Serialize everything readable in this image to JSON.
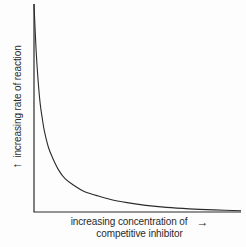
{
  "figure": {
    "background_color": "#fdfdfd",
    "line_color": "#2b2b2b"
  },
  "axes": {
    "y": {
      "label": "increasing rate of reaction",
      "arrow_glyph": "↑",
      "arrow_name": "up-arrow-icon"
    },
    "x": {
      "label_line_one": "increasing concentration of",
      "label_line_two": "competitive inhibitor",
      "arrow_glyph": "→",
      "arrow_name": "right-arrow-icon"
    }
  },
  "chart_data": {
    "type": "line",
    "title": "",
    "xlabel": "increasing concentration of competitive inhibitor",
    "ylabel": "increasing rate of reaction",
    "xlim": [
      0,
      100
    ],
    "ylim": [
      0,
      100
    ],
    "grid": false,
    "legend": "none",
    "axis_ticks": "none",
    "annotations": [
      "y-axis arrow indicates increasing rate of reaction",
      "x-axis arrow indicates increasing concentration of competitive inhibitor"
    ],
    "series": [
      {
        "name": "rate of reaction vs competitive inhibitor concentration",
        "shape": "hyperbolic decay",
        "x": [
          0,
          1,
          2,
          3,
          4,
          5,
          7,
          9,
          12,
          15,
          19,
          24,
          30,
          37,
          45,
          54,
          64,
          75,
          87,
          100
        ],
        "y": [
          100,
          78,
          63,
          52,
          45,
          39,
          31,
          26,
          20,
          16,
          13,
          10,
          8,
          6,
          4.5,
          3.2,
          2.2,
          1.5,
          1.0,
          0.6
        ]
      }
    ]
  }
}
